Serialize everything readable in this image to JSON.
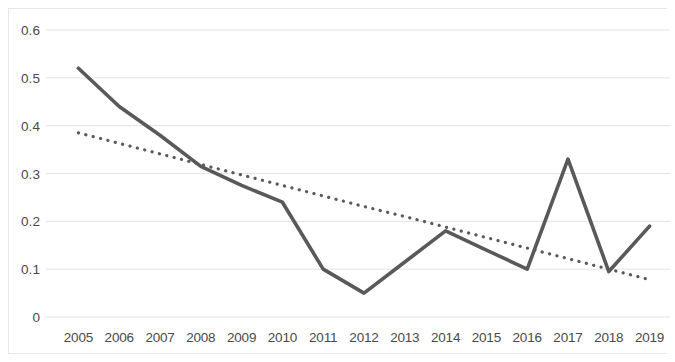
{
  "chart_data": {
    "type": "line",
    "title": "",
    "subtitle": "",
    "xlabel": "",
    "ylabel": "",
    "categories": [
      "2005",
      "2006",
      "2007",
      "2008",
      "2009",
      "2010",
      "2011",
      "2012",
      "2013",
      "2014",
      "2015",
      "2016",
      "2017",
      "2018",
      "2019"
    ],
    "series": [
      {
        "name": "series-1",
        "style": "solid",
        "color": "#595959",
        "values": [
          0.52,
          0.44,
          0.38,
          0.315,
          0.275,
          0.24,
          0.1,
          0.05,
          0.115,
          0.18,
          0.14,
          0.1,
          0.33,
          0.095,
          0.19
        ]
      },
      {
        "name": "trendline",
        "style": "dotted",
        "color": "#5a5a5a",
        "values": [
          0.385,
          0.363,
          0.341,
          0.319,
          0.297,
          0.275,
          0.253,
          0.231,
          0.21,
          0.188,
          0.166,
          0.144,
          0.122,
          0.1,
          0.078
        ]
      }
    ],
    "ylim": [
      0,
      0.6
    ],
    "y_ticks": [
      0.6,
      0.5,
      0.4,
      0.3,
      0.2,
      0.1,
      0
    ],
    "y_tick_labels": [
      "0.6",
      "0.5",
      "0.4",
      "0.3",
      "0.2",
      "0.1",
      "0"
    ],
    "grid": true,
    "grid_axis": "y",
    "grid_color": "#e3e3e3",
    "legend": "none",
    "legend_position": "none",
    "annotations": [],
    "background_color": "#ffffff",
    "axis_label_color": "#4a4a4a"
  }
}
